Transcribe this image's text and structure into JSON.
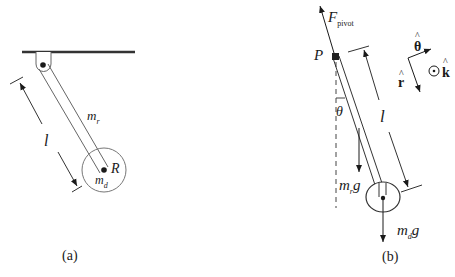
{
  "diagram": {
    "type": "physics-free-body-diagram",
    "colors": {
      "ink": "#1a1a1a",
      "line": "#555555",
      "background": "#ffffff"
    }
  },
  "panel_a": {
    "caption": "(a)",
    "labels": {
      "rod_mass": "m",
      "rod_mass_sub": "r",
      "disc_radius": "R",
      "disc_mass": "m",
      "disc_mass_sub": "d",
      "length": "l"
    }
  },
  "panel_b": {
    "caption": "(b)",
    "labels": {
      "pivot_point": "P",
      "pivot_force": "F",
      "pivot_force_sub": "pivot",
      "angle": "θ",
      "length": "l",
      "rod_weight": "m",
      "rod_weight_sub": "r",
      "rod_weight_g": "g",
      "disc_weight": "m",
      "disc_weight_sub": "d",
      "disc_weight_g": "g"
    },
    "unit_vectors": {
      "theta_hat": "θ",
      "r_hat": "r",
      "k_hat": "k",
      "hat": "^",
      "out_of_page_symbol": "⊙"
    }
  }
}
